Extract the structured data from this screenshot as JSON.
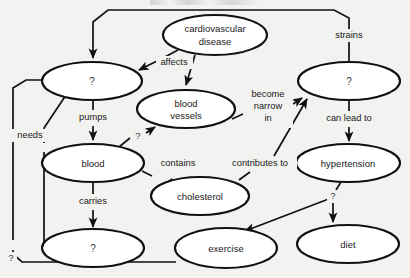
{
  "diagram": {
    "type": "concept-map",
    "colors": {
      "background": "#f2f2f0",
      "node_fill": "#ffffff",
      "stroke": "#111111",
      "text": "#1a1a1a",
      "placeholder_text": "#3a3a3a"
    },
    "nodes": [
      {
        "id": "cardiovascular-disease",
        "label": "cardiovascular disease",
        "line1": "cardiovascular",
        "line2": "disease",
        "cx": 215,
        "cy": 35,
        "rx": 52,
        "ry": 20,
        "lines": 2
      },
      {
        "id": "node-heart-unknown",
        "label": "?",
        "cx": 92,
        "cy": 81,
        "rx": 50,
        "ry": 19,
        "lines": 1
      },
      {
        "id": "blood-vessels",
        "label": "blood vessels",
        "line1": "blood",
        "line2": "vessels",
        "cx": 186,
        "cy": 109,
        "rx": 49,
        "ry": 19,
        "lines": 2
      },
      {
        "id": "node-arteries-unknown",
        "label": "?",
        "cx": 349,
        "cy": 81,
        "rx": 51,
        "ry": 19,
        "lines": 1
      },
      {
        "id": "blood",
        "label": "blood",
        "cx": 93,
        "cy": 163,
        "rx": 51,
        "ry": 19,
        "lines": 1
      },
      {
        "id": "cholesterol",
        "label": "cholesterol",
        "cx": 200,
        "cy": 196,
        "rx": 49,
        "ry": 19,
        "lines": 1
      },
      {
        "id": "hypertension",
        "label": "hypertension",
        "cx": 348,
        "cy": 163,
        "rx": 52,
        "ry": 19,
        "lines": 1
      },
      {
        "id": "node-lifestyle-unknown",
        "label": "?",
        "cx": 93,
        "cy": 248,
        "rx": 51,
        "ry": 19,
        "lines": 1
      },
      {
        "id": "exercise",
        "label": "exercise",
        "cx": 226,
        "cy": 248,
        "rx": 51,
        "ry": 20,
        "lines": 1
      },
      {
        "id": "diet",
        "label": "diet",
        "cx": 348,
        "cy": 244,
        "rx": 51,
        "ry": 19,
        "lines": 1
      }
    ],
    "edges": [
      {
        "id": "edge-strains",
        "from": "node-arteries-unknown",
        "to": "node-heart-unknown",
        "label": "strains",
        "label_x": 349,
        "label_y": 36
      },
      {
        "id": "edge-affects",
        "from": "cardiovascular-disease",
        "to": "node-heart-unknown",
        "label": "affects",
        "label_x": 174,
        "label_y": 63
      },
      {
        "id": "edge-affects-vessels",
        "from": "cardiovascular-disease",
        "to": "blood-vessels",
        "label": "",
        "label_x": 0,
        "label_y": 0
      },
      {
        "id": "edge-pumps",
        "from": "node-heart-unknown",
        "to": "blood",
        "label": "pumps",
        "label_x": 93,
        "label_y": 118
      },
      {
        "id": "edge-needs",
        "from": "node-heart-unknown",
        "to": "node-heart-unknown",
        "label": "needs",
        "label_x": 30,
        "label_y": 136
      },
      {
        "id": "edge-blood-to-vessels",
        "from": "blood",
        "to": "blood-vessels",
        "label": "?",
        "label_x": 138,
        "label_y": 136
      },
      {
        "id": "edge-become-narrow-in",
        "from": "blood-vessels",
        "to": "node-arteries-unknown",
        "label": "become narrow in",
        "line1": "become",
        "line2": "narrow",
        "line3": "in",
        "label_x": 268,
        "label_y": 108
      },
      {
        "id": "edge-can-lead-to",
        "from": "node-arteries-unknown",
        "to": "hypertension",
        "label": "can lead to",
        "label_x": 349,
        "label_y": 119
      },
      {
        "id": "edge-contains",
        "from": "blood",
        "to": "cholesterol",
        "label": "contains",
        "label_x": 178,
        "label_y": 164
      },
      {
        "id": "edge-contributes-to",
        "from": "cholesterol",
        "to": "node-arteries-unknown",
        "label": "contributes to",
        "label_x": 260,
        "label_y": 164
      },
      {
        "id": "edge-carries",
        "from": "blood",
        "to": "node-lifestyle-unknown",
        "label": "carries",
        "label_x": 93,
        "label_y": 202
      },
      {
        "id": "edge-hypertension-diet",
        "from": "hypertension",
        "to": "diet",
        "label": "?",
        "label_x": 332,
        "label_y": 196
      },
      {
        "id": "edge-hypertension-exercise",
        "from": "hypertension",
        "to": "exercise",
        "label": "",
        "label_x": 0,
        "label_y": 0
      },
      {
        "id": "edge-exercise-loop",
        "from": "exercise",
        "to": "node-heart-unknown",
        "label": "?",
        "label_x": 11,
        "label_y": 258
      }
    ]
  }
}
